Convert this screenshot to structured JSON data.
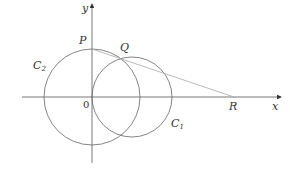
{
  "diagram": {
    "type": "geometry",
    "labels": {
      "y_axis": "y",
      "x_axis": "x",
      "origin": "0",
      "P": "P",
      "Q": "Q",
      "R": "R",
      "C1_main": "C",
      "C1_sub": "1",
      "C2_main": "C",
      "C2_sub": "2"
    },
    "colors": {
      "axis": "#444444",
      "circle": "#666666",
      "line": "#aaaaaa",
      "text": "#333333"
    },
    "elements": [
      {
        "name": "circle C2",
        "center": "origin",
        "passes_through": "P"
      },
      {
        "name": "circle C1",
        "center_on": "x-axis",
        "passes_through": "origin"
      },
      {
        "name": "line PQR",
        "from": "P",
        "through": "Q",
        "to": "R on x-axis"
      }
    ]
  }
}
